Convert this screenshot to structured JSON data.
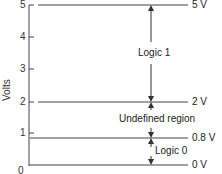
{
  "diagram": {
    "type": "logic-level voltage diagram",
    "y_axis": {
      "label": "Volts",
      "ticks": [
        "0",
        "1",
        "2",
        "3",
        "4",
        "5"
      ]
    },
    "levels": [
      {
        "name": "5V",
        "label": "5 V",
        "value": 5
      },
      {
        "name": "2V",
        "label": "2 V",
        "value": 2
      },
      {
        "name": "0.8V",
        "label": "0.8 V",
        "value": 0.8
      },
      {
        "name": "0V",
        "label": "0 V",
        "value": 0
      }
    ],
    "regions": [
      {
        "name": "logic-1",
        "label": "Logic 1",
        "from": 2,
        "to": 5
      },
      {
        "name": "undefined",
        "label": "Undefined region",
        "from": 0.8,
        "to": 2
      },
      {
        "name": "logic-0",
        "label": "Logic 0",
        "from": 0,
        "to": 0.8
      }
    ],
    "colors": {
      "line": "#333333",
      "background": "#ffffff"
    }
  }
}
